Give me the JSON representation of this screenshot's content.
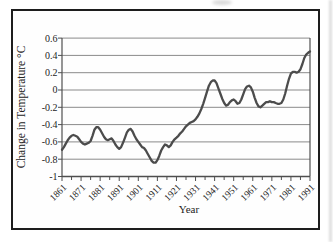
{
  "figure": {
    "background": "#fefefe",
    "frame_border_color": "#1d1d1d",
    "grid_color": "#8a8a8a",
    "axis_color": "#4f4f4f",
    "line_color": "#4c4c4c",
    "text_color": "#242424"
  },
  "chart_data": {
    "type": "line",
    "title": "",
    "xlabel": "Year",
    "ylabel": "Change in Temperature °C",
    "xlim": [
      1861,
      1991
    ],
    "ylim": [
      -1,
      0.6
    ],
    "grid": "horizontal",
    "legend": "none",
    "x_ticks": [
      1861,
      1871,
      1881,
      1891,
      1901,
      1911,
      1921,
      1931,
      1941,
      1951,
      1961,
      1971,
      1981,
      1991
    ],
    "x_minor_tick_step": 5,
    "y_ticks": [
      0.6,
      0.4,
      0.2,
      0,
      -0.2,
      -0.4,
      -0.6,
      -0.8,
      -1
    ],
    "y_tick_labels": [
      "0.6",
      "0.4",
      "0.2",
      "0",
      "-0.2",
      "-0.4",
      "-0.6",
      "-0.8",
      "-1"
    ],
    "series": [
      {
        "name": "smoothed-global-temperature-change",
        "x_start": 1861,
        "x_step": 1,
        "values": [
          -0.69,
          -0.66,
          -0.62,
          -0.58,
          -0.55,
          -0.53,
          -0.52,
          -0.53,
          -0.54,
          -0.57,
          -0.6,
          -0.62,
          -0.63,
          -0.62,
          -0.61,
          -0.59,
          -0.53,
          -0.46,
          -0.43,
          -0.43,
          -0.46,
          -0.5,
          -0.54,
          -0.57,
          -0.58,
          -0.57,
          -0.56,
          -0.59,
          -0.63,
          -0.66,
          -0.68,
          -0.66,
          -0.61,
          -0.55,
          -0.49,
          -0.46,
          -0.45,
          -0.48,
          -0.53,
          -0.57,
          -0.6,
          -0.63,
          -0.66,
          -0.67,
          -0.7,
          -0.74,
          -0.78,
          -0.82,
          -0.84,
          -0.84,
          -0.81,
          -0.76,
          -0.7,
          -0.66,
          -0.63,
          -0.64,
          -0.66,
          -0.64,
          -0.6,
          -0.57,
          -0.55,
          -0.53,
          -0.5,
          -0.48,
          -0.45,
          -0.42,
          -0.4,
          -0.38,
          -0.37,
          -0.36,
          -0.34,
          -0.31,
          -0.27,
          -0.22,
          -0.16,
          -0.09,
          -0.02,
          0.05,
          0.09,
          0.11,
          0.11,
          0.08,
          0.02,
          -0.04,
          -0.1,
          -0.15,
          -0.18,
          -0.17,
          -0.14,
          -0.12,
          -0.11,
          -0.13,
          -0.16,
          -0.15,
          -0.11,
          -0.05,
          0.01,
          0.04,
          0.05,
          0.03,
          -0.02,
          -0.09,
          -0.15,
          -0.19,
          -0.2,
          -0.18,
          -0.16,
          -0.14,
          -0.14,
          -0.13,
          -0.14,
          -0.14,
          -0.15,
          -0.16,
          -0.16,
          -0.15,
          -0.11,
          -0.04,
          0.05,
          0.13,
          0.19,
          0.21,
          0.21,
          0.2,
          0.21,
          0.24,
          0.3,
          0.37,
          0.41,
          0.43,
          0.445
        ]
      }
    ]
  }
}
